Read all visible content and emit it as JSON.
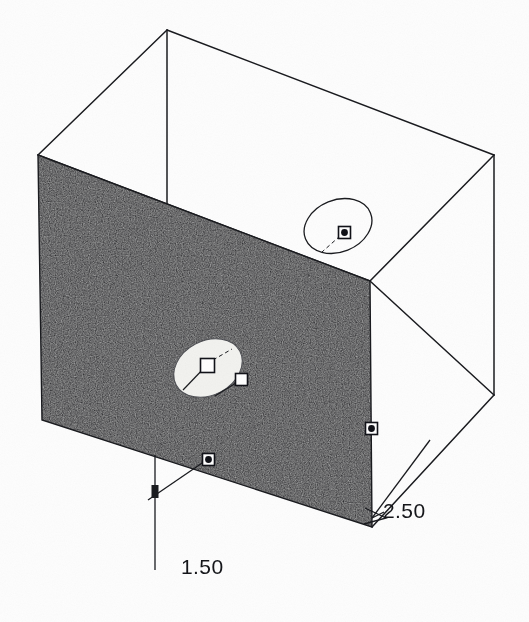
{
  "scene": {
    "title": "3D Solid Box with Circular Hole",
    "background_color": "#fdfdfd",
    "line_color": "#1a1b1f",
    "shaded_face_color": "#232428",
    "hole_fill_color": "#f2f2ef",
    "handle_fill_color": "#ffffff",
    "handle_stroke_color": "#111218"
  },
  "dimensions": [
    {
      "name": "height-dimension",
      "value": "1.50",
      "orientation": "vertical",
      "leader_from_x": 208,
      "leader_from_y": 459
    },
    {
      "name": "width-dimension",
      "value": "2.50",
      "orientation": "diagonal",
      "leader_from_x": 430,
      "leader_from_y": 440
    }
  ],
  "box": {
    "name": "wireframe-box",
    "vertices": {
      "top_apex": [
        167,
        30
      ],
      "top_left": [
        38,
        155
      ],
      "top_right": [
        494,
        155
      ],
      "top_front": [
        370,
        281
      ],
      "front_top_left": [
        38,
        155
      ],
      "front_top_right": [
        370,
        281
      ],
      "front_bot_left": [
        42,
        420
      ],
      "front_bot_right": [
        372,
        527
      ],
      "right_bot": [
        494,
        395
      ],
      "bottom_front": [
        372,
        527
      ]
    }
  },
  "features": [
    {
      "name": "front-face-hole",
      "type": "ellipse",
      "cx": 208,
      "cy": 368,
      "rx": 36,
      "ry": 27,
      "rotation": -28,
      "filled": true,
      "fill": "#f2f2ef"
    },
    {
      "name": "top-face-hole",
      "type": "ellipse",
      "cx": 338,
      "cy": 226,
      "rx": 35,
      "ry": 26,
      "rotation": -22,
      "filled": false,
      "fill": "none"
    }
  ],
  "handles": [
    {
      "name": "handle-hole-center",
      "x": 207,
      "y": 365,
      "size": 13,
      "style": "hollow"
    },
    {
      "name": "handle-hole-radius",
      "x": 241,
      "y": 379,
      "size": 11,
      "style": "hollow"
    },
    {
      "name": "handle-top-hole-center",
      "x": 344,
      "y": 232,
      "size": 11,
      "style": "dot"
    },
    {
      "name": "handle-right-edge",
      "x": 371,
      "y": 428,
      "size": 11,
      "style": "dot"
    },
    {
      "name": "handle-bottom-edge",
      "x": 208,
      "y": 459,
      "size": 11,
      "style": "dot"
    }
  ],
  "annotations": {
    "grain_visible": true,
    "render_style": "hidden-line with shaded front face"
  }
}
